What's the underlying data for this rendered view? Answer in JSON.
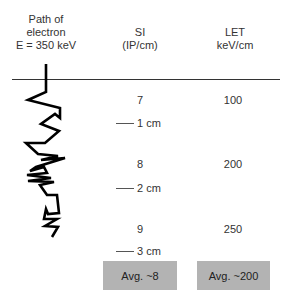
{
  "headers": {
    "path": {
      "line1": "Path of",
      "line2": "electron",
      "line3": "E = 350 keV"
    },
    "si": {
      "line1": "SI",
      "line2": "(IP/cm)"
    },
    "let": {
      "line1": "LET",
      "line2": "keV/cm"
    }
  },
  "rows": [
    {
      "si": "7",
      "let": "100",
      "distance": "1 cm"
    },
    {
      "si": "8",
      "let": "200",
      "distance": "2 cm"
    },
    {
      "si": "9",
      "let": "250",
      "distance": "3 cm"
    }
  ],
  "averages": {
    "si": "Avg. ~8",
    "let": "Avg. ~200"
  },
  "colors": {
    "avg_box": "#b3b3b3",
    "path": "#000000",
    "rule": "#333333"
  }
}
